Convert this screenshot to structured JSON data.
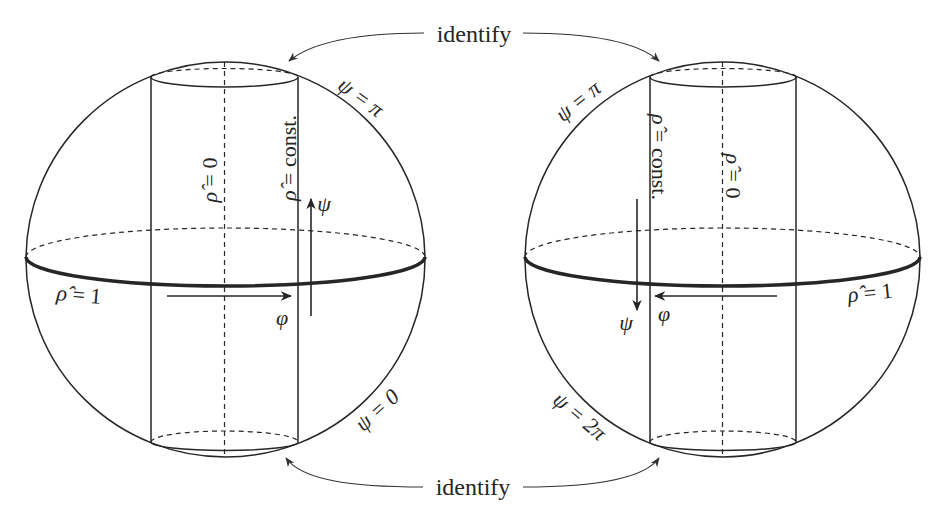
{
  "figure": {
    "identify_top": "identify",
    "identify_bottom": "identify",
    "left_sphere": {
      "rho_zero": {
        "sym": "ρ̂",
        "rest": " = 0"
      },
      "rho_const": {
        "sym": "ρ̂",
        "rest": " = const."
      },
      "rho_one": {
        "sym": "ρ̂",
        "rest": " = 1"
      },
      "psi_pi": "ψ = π",
      "psi_zero": "ψ = 0",
      "psi_arrow_label": "ψ",
      "phi_arrow_label": "φ",
      "psi_arrow_direction": "up",
      "phi_arrow_direction": "right"
    },
    "right_sphere": {
      "rho_zero": {
        "sym": "ρ̂",
        "rest": " = 0"
      },
      "rho_const": {
        "sym": "ρ̂",
        "rest": " = const."
      },
      "rho_one": {
        "sym": "ρ̂",
        "rest": " = 1"
      },
      "psi_pi": "ψ = π",
      "psi_two_pi": "ψ = 2π",
      "psi_arrow_label": "ψ",
      "phi_arrow_label": "φ",
      "psi_arrow_direction": "down",
      "phi_arrow_direction": "left"
    }
  },
  "colors": {
    "line": "#262626",
    "background": "#ffffff"
  }
}
